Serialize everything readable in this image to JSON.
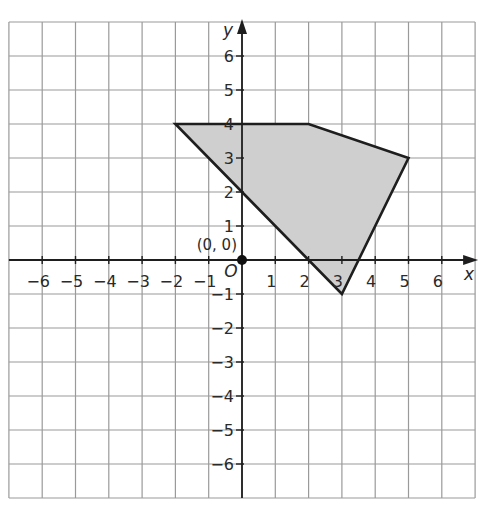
{
  "diagram": {
    "type": "coordinate-plane-polygon",
    "axes": {
      "x_label": "x",
      "y_label": "y",
      "x_range": [
        -7,
        7
      ],
      "y_range": [
        -7,
        7
      ],
      "x_ticks": [
        -6,
        -5,
        -4,
        -3,
        -2,
        -1,
        1,
        2,
        3,
        4,
        5,
        6
      ],
      "y_ticks": [
        -6,
        -5,
        -4,
        -3,
        -2,
        -1,
        1,
        2,
        3,
        4,
        5,
        6
      ],
      "x_tick_labels": [
        "−6",
        "−5",
        "−4",
        "−3",
        "−2",
        "−1",
        "1",
        "2",
        "3",
        "4",
        "5",
        "6"
      ],
      "y_tick_labels": [
        "−6",
        "−5",
        "−4",
        "−3",
        "−2",
        "−1",
        "1",
        "2",
        "3",
        "4",
        "5",
        "6"
      ],
      "origin_letter": "O"
    },
    "origin_point": {
      "label": "(0, 0)",
      "x": 0,
      "y": 0
    },
    "polygon": {
      "vertices": [
        [
          -2,
          4
        ],
        [
          2,
          4
        ],
        [
          5,
          3
        ],
        [
          3,
          -1
        ],
        [
          0,
          2
        ]
      ],
      "fill": "#cfcfcf",
      "stroke": "#1e1e1e"
    },
    "colors": {
      "grid": "#9a9a9a",
      "axis": "#1e1e1e",
      "background": "#ffffff"
    }
  }
}
